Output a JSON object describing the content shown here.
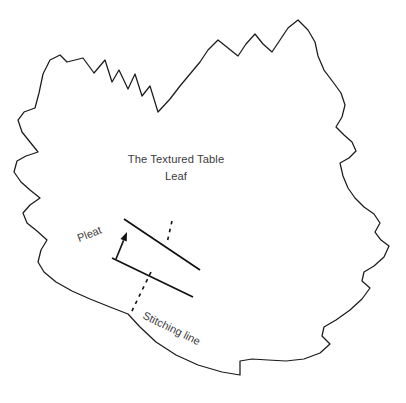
{
  "document": {
    "type": "sewing-pattern-template",
    "background_color": "#ffffff",
    "outline_color": "#1b1b1b",
    "text_color": "#3c3c3c",
    "marking_color": "#111111",
    "canvas": {
      "width": 406,
      "height": 403
    }
  },
  "title": {
    "line1": "The Textured Table",
    "line2": "Leaf"
  },
  "annotations": {
    "pleat_label": "Pleat",
    "stitching_label": "Stitching line"
  },
  "shapes": {
    "leaf_name": "maple-leaf-outline",
    "leaf_path": "M 158 112 L 150 86 L 142 96 L 135 74 L 128 89 L 119 70 L 112 82 L 105 60 L 94 73 L 83 58 L 67 62 L 60 55 L 50 60 L 43 74 L 39 93 L 35 108 L 24 112 L 18 120 L 22 132 L 30 142 L 38 152 L 26 156 L 17 161 L 14 172 L 21 182 L 30 190 L 40 198 L 30 205 L 23 213 L 27 223 L 37 231 L 47 240 L 41 250 L 38 262 L 44 272 L 56 282 L 72 291 L 90 299 L 110 307 L 128 314 L 140 327 L 156 342 L 176 355 L 198 365 L 222 372 L 240 375 L 240 361 L 252 359 L 268 360 L 286 361 L 304 359 L 320 353 L 330 344 L 322 336 L 324 327 L 336 320 L 350 310 L 362 299 L 370 288 L 362 281 L 364 272 L 374 266 L 384 257 L 389 246 L 381 240 L 375 232 L 380 223 L 374 214 L 364 207 L 355 198 L 348 188 L 343 176 L 340 163 L 349 158 L 356 151 L 352 142 L 344 135 L 336 127 L 342 117 L 345 105 L 341 93 L 333 82 L 324 70 L 318 56 L 315 42 L 308 30 L 298 20 L 288 28 L 280 40 L 272 52 L 263 44 L 255 34 L 246 44 L 238 56 L 228 48 L 218 40 L 208 50 L 200 62 L 190 74 L 180 86 L 170 99 L 158 112 Z",
    "upper_fold_line": {
      "x1": 124,
      "y1": 219,
      "x2": 200,
      "y2": 270
    },
    "lower_fold_line": {
      "x1": 112,
      "y1": 258,
      "x2": 193,
      "y2": 297
    },
    "dashed_short": {
      "x1": 172,
      "y1": 221,
      "x2": 167,
      "y2": 243
    },
    "dashed_long": {
      "x1": 151,
      "y1": 272,
      "x2": 130,
      "y2": 315
    },
    "arrow": {
      "x1": 116,
      "y1": 259,
      "x2": 127,
      "y2": 232
    }
  }
}
